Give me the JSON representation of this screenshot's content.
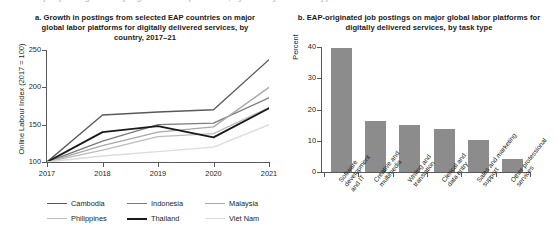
{
  "cutoff_caption": "Share of job postings on major global labor platforms, by country and task type",
  "panel_a": {
    "title": "a. Growth in postings from selected EAP countries on major global labor platforms for digitally delivered services, by country, 2017–21",
    "ylabel": "Online Labour Index (2017 = 100)",
    "y_ticks": [
      "100",
      "150",
      "200",
      "250"
    ],
    "x_ticks": [
      "2017",
      "2018",
      "2019",
      "2020",
      "2021"
    ],
    "legend": [
      {
        "label": "Cambodia",
        "color": "#5a5a5a"
      },
      {
        "label": "Indonesia",
        "color": "#7b7b7b"
      },
      {
        "label": "Malaysia",
        "color": "#a8a8a8"
      },
      {
        "label": "Philippines",
        "color": "#bcbcbc"
      },
      {
        "label": "Thailand",
        "color": "#1a1a1a"
      },
      {
        "label": "Viet Nam",
        "color": "#dcdcdc"
      }
    ]
  },
  "panel_b": {
    "title": "b. EAP-originated job postings on major global labor platforms for digitally delivered services, by task type",
    "ylabel": "Percent",
    "y_ticks": [
      "0",
      "10",
      "20",
      "30",
      "40"
    ],
    "bar_color": "#8c8c8c"
  },
  "chart_data": [
    {
      "type": "line",
      "panel": "a",
      "title": "a. Growth in postings from selected EAP countries on major global labor platforms for digitally delivered services, by country, 2017–21",
      "xlabel": "",
      "ylabel": "Online Labour Index (2017 = 100)",
      "x": [
        "2017",
        "2018",
        "2019",
        "2020",
        "2021"
      ],
      "ylim": [
        100,
        250
      ],
      "yticks": [
        100,
        150,
        200,
        250
      ],
      "grid": false,
      "legend_position": "bottom",
      "series": [
        {
          "name": "Cambodia",
          "color": "#5a5a5a",
          "values": [
            100,
            163,
            167,
            170,
            237
          ]
        },
        {
          "name": "Indonesia",
          "color": "#7b7b7b",
          "values": [
            100,
            128,
            150,
            152,
            186
          ]
        },
        {
          "name": "Malaysia",
          "color": "#a8a8a8",
          "values": [
            100,
            122,
            140,
            147,
            200
          ]
        },
        {
          "name": "Philippines",
          "color": "#bcbcbc",
          "values": [
            100,
            116,
            134,
            138,
            173
          ]
        },
        {
          "name": "Thailand",
          "color": "#1a1a1a",
          "values": [
            100,
            140,
            148,
            133,
            172
          ]
        },
        {
          "name": "Viet Nam",
          "color": "#dcdcdc",
          "values": [
            100,
            108,
            114,
            120,
            150
          ]
        }
      ]
    },
    {
      "type": "bar",
      "panel": "b",
      "title": "b. EAP-originated job postings on major global labor platforms for digitally delivered services, by task type",
      "xlabel": "",
      "ylabel": "Percent",
      "ylim": [
        0,
        40
      ],
      "yticks": [
        0,
        10,
        20,
        30,
        40
      ],
      "grid": false,
      "bar_color": "#8c8c8c",
      "categories": [
        "Software development and IT",
        "Creative and multimedia",
        "Writing and translation",
        "Clerical and data entry",
        "Sales and marketing support",
        "Other professional services"
      ],
      "category_lines": [
        [
          "Software",
          "development",
          "and IT"
        ],
        [
          "Creative and",
          "multimedia"
        ],
        [
          "Writing and",
          "translation"
        ],
        [
          "Clerical and",
          "data entry"
        ],
        [
          "Sales and marketing",
          "support"
        ],
        [
          "Other professional",
          "services"
        ]
      ],
      "values": [
        39.7,
        16.3,
        15.1,
        13.8,
        10.2,
        4.1
      ]
    }
  ]
}
